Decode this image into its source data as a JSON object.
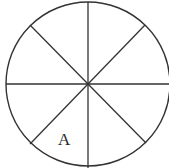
{
  "diagram": {
    "type": "circle-divided-into-sectors",
    "sectors": 8,
    "stroke_color": "#333333",
    "background": "#ffffff",
    "labels": [
      {
        "text": "A",
        "sector": "lower-left, adjacent to the downward vertical line"
      }
    ]
  }
}
